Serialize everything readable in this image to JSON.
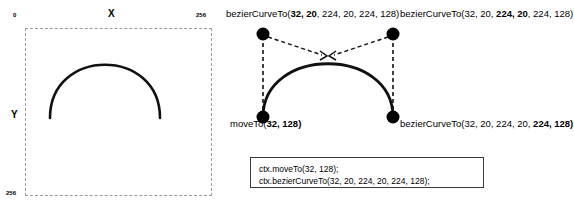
{
  "canvas_panel": {
    "origin_label": "0",
    "x_axis_label": "X",
    "x_max_label": "256",
    "y_axis_label": "Y",
    "y_max_label": "256",
    "curve_color": "#111111",
    "box_border_color": "#9a9a9a"
  },
  "diagram": {
    "point_color": "#000000",
    "curve_color": "#111111",
    "guide_color": "#111111",
    "control_point_1": {
      "prefix": "bezierCurveTo(",
      "bold": "32, 20",
      "suffix": ", 224, 20, 224, 128)"
    },
    "control_point_2": {
      "prefix": "bezierCurveTo(32, 20, ",
      "bold": "224, 20",
      "suffix": ", 224, 128)"
    },
    "start_point": {
      "prefix": "moveTo(",
      "bold": "32, 128)",
      "suffix": ""
    },
    "end_point": {
      "prefix": "bezierCurveTo(32, 20, 224, 20, ",
      "bold": "224, 128)",
      "suffix": ""
    }
  },
  "code_box": {
    "line1": "ctx.moveTo(32, 128);",
    "line2": "ctx.bezierCurveTo(32, 20, 224, 20, 224, 128);",
    "border_color": "#3a3a3a"
  }
}
